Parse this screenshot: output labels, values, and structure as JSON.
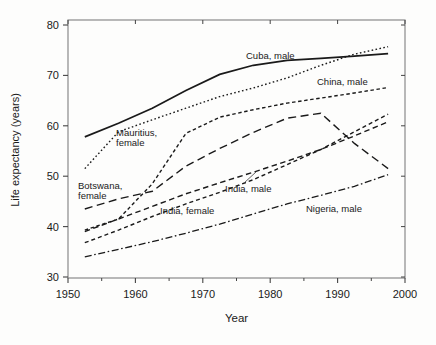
{
  "chart_data": {
    "type": "line",
    "title": "",
    "xlabel": "Year",
    "ylabel": "Life expectancy (years)",
    "xlim": [
      1950,
      2000
    ],
    "ylim": [
      30,
      80
    ],
    "x_ticks": [
      1950,
      1960,
      1970,
      1980,
      1990,
      2000
    ],
    "x_minor_ticks": [
      1955,
      1965,
      1975,
      1985,
      1995
    ],
    "y_ticks": [
      30,
      40,
      50,
      60,
      70,
      80
    ],
    "grid": false,
    "frame": "box",
    "legend_position": "inline-annotations",
    "x": [
      1952.5,
      1957.5,
      1962.5,
      1967.5,
      1972.5,
      1977.5,
      1982.5,
      1987.5,
      1992.5,
      1997.5
    ],
    "series": [
      {
        "name": "cuba-male",
        "label": "Cuba, male",
        "dash": "solid",
        "width": 1.7,
        "values": [
          57.8,
          60.5,
          63.5,
          67.0,
          70.2,
          72.0,
          73.0,
          73.4,
          73.8,
          74.3
        ],
        "annotation": {
          "lines": [
            "Cuba, male"
          ],
          "px": [
            246,
            51
          ]
        }
      },
      {
        "name": "mauritius-female",
        "label": "Mauritius, female",
        "dash": "dotted",
        "width": 1.4,
        "values": [
          51.5,
          58.8,
          61.2,
          63.5,
          65.8,
          67.5,
          69.5,
          72.0,
          74.2,
          75.7
        ],
        "annotation": {
          "lines": [
            "Mauritius,",
            "female"
          ],
          "px": [
            116,
            128
          ]
        }
      },
      {
        "name": "china-male",
        "label": "China, male",
        "dash": "shortdash",
        "width": 1.4,
        "values": [
          39.3,
          41.5,
          48.5,
          58.5,
          61.7,
          63.2,
          64.5,
          65.5,
          66.5,
          67.6
        ],
        "annotation": {
          "lines": [
            "China, male"
          ],
          "px": [
            317,
            77
          ]
        }
      },
      {
        "name": "botswana-female",
        "label": "Botswana, female",
        "dash": "longdash",
        "width": 1.4,
        "values": [
          43.5,
          45.5,
          47.0,
          52.0,
          55.5,
          58.7,
          61.5,
          62.5,
          56.5,
          51.5
        ],
        "annotation": {
          "lines": [
            "Botswana,",
            "female"
          ],
          "px": [
            78,
            181
          ]
        }
      },
      {
        "name": "india-male",
        "label": "India, male",
        "dash": "meddash",
        "width": 1.4,
        "values": [
          39.0,
          41.5,
          44.0,
          46.5,
          48.7,
          50.8,
          53.0,
          55.3,
          58.0,
          60.8
        ],
        "annotation": {
          "lines": [
            "India, male"
          ],
          "px": [
            225,
            184
          ],
          "leader": [
            244,
            183,
            256,
            172
          ]
        }
      },
      {
        "name": "india-female",
        "label": "India, female",
        "dash": "shortmed",
        "width": 1.4,
        "values": [
          36.8,
          39.3,
          42.0,
          44.5,
          46.8,
          49.3,
          52.3,
          55.3,
          58.8,
          62.3
        ],
        "annotation": {
          "lines": [
            "India, female"
          ],
          "px": [
            160,
            206
          ]
        }
      },
      {
        "name": "nigeria-male",
        "label": "Nigeria, male",
        "dash": "dashdot",
        "width": 1.3,
        "values": [
          34.0,
          35.5,
          37.0,
          38.7,
          40.5,
          42.5,
          44.5,
          46.2,
          48.0,
          50.3
        ],
        "annotation": {
          "lines": [
            "Nigeria, male"
          ],
          "px": [
            306,
            204
          ]
        }
      }
    ],
    "colors": {
      "line": "#1a1a1a",
      "frame": "#8a8a8a",
      "tick": "#444444",
      "text": "#1a1a1a"
    }
  },
  "layout_px": {
    "width": 436,
    "height": 345,
    "plot": {
      "left": 68,
      "right": 405,
      "top": 20,
      "bottom": 278
    },
    "y_of_80": 25,
    "y_of_30": 277
  }
}
